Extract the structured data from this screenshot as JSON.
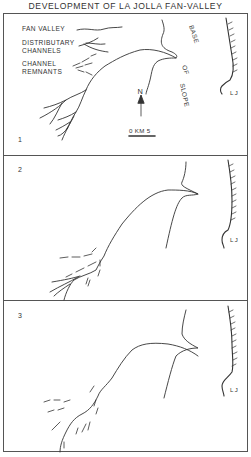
{
  "title": "DEVELOPMENT OF LA JOLLA FAN-VALLEY",
  "legend": {
    "fan_valley": "FAN VALLEY",
    "distributary_line1": "DISTRIBUTARY",
    "distributary_line2": "CHANNELS",
    "remnants_line1": "CHANNEL",
    "remnants_line2": "REMNANTS"
  },
  "annotations": {
    "base": "BASE",
    "of": "OF",
    "slope": "SLOPE",
    "coast_label": "L J",
    "north": "N",
    "scale": "0 KM 5"
  },
  "panels": [
    {
      "number": "1",
      "stage": "Fan valley with distributary channels"
    },
    {
      "number": "2",
      "stage": "Distributaries with channel remnants"
    },
    {
      "number": "3",
      "stage": "Channel remnants only"
    }
  ],
  "colors": {
    "line": "#333333",
    "frame": "#555555",
    "background": "#ffffff"
  }
}
